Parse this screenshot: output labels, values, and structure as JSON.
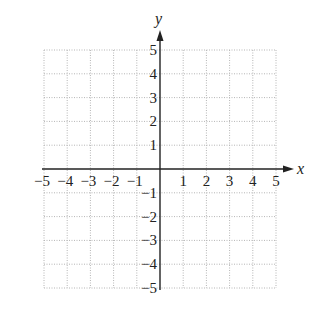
{
  "chart_data": {
    "type": "scatter",
    "title": "",
    "xlabel": "x",
    "ylabel": "y",
    "xlim": [
      -5,
      5
    ],
    "ylim": [
      -5,
      5
    ],
    "grid": true,
    "grid_style": "dotted",
    "legend": null,
    "x_ticks": [
      -5,
      -4,
      -3,
      -2,
      -1,
      1,
      2,
      3,
      4,
      5
    ],
    "y_ticks": [
      5,
      4,
      3,
      2,
      1,
      -1,
      -2,
      -3,
      -4,
      -5
    ],
    "x_tick_labels": [
      "−5",
      "−4",
      "−3",
      "−2",
      "−1",
      "1",
      "2",
      "3",
      "4",
      "5"
    ],
    "y_tick_labels": [
      "5",
      "4",
      "3",
      "2",
      "1",
      "−1",
      "−2",
      "−3",
      "−4",
      "−5"
    ],
    "series": []
  },
  "colors": {
    "axis": "#222222",
    "grid": "#b5b5b5",
    "text": "#222222",
    "background": "#ffffff"
  },
  "icons": {
    "x_arrow": "arrow-right-icon",
    "y_arrow": "arrow-up-icon"
  }
}
